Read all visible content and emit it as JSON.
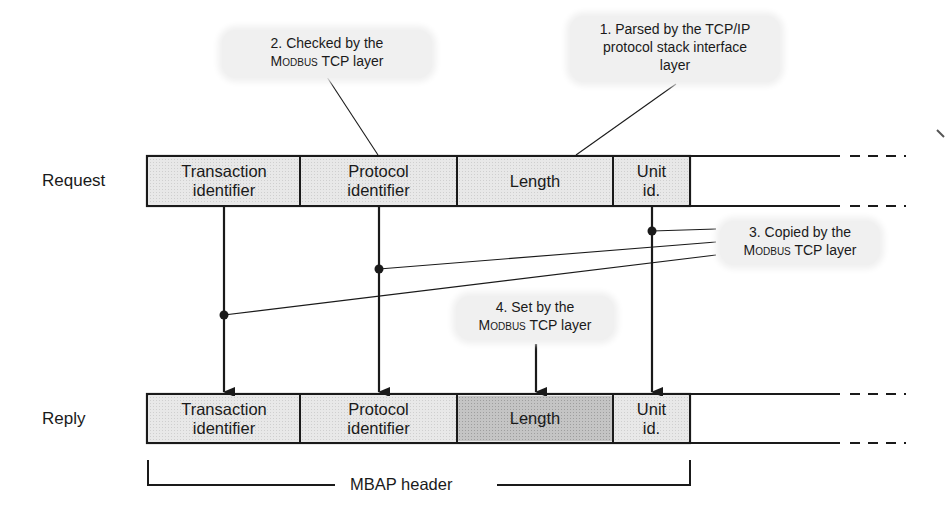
{
  "diagram": {
    "type": "protocol-frame-flow",
    "rows": {
      "request": {
        "label": "Request",
        "fields": [
          {
            "line1": "Transaction",
            "line2": "identifier",
            "shade": "light"
          },
          {
            "line1": "Protocol",
            "line2": "identifier",
            "shade": "light"
          },
          {
            "line1": "Length",
            "line2": "",
            "shade": "light"
          },
          {
            "line1": "Unit",
            "line2": "id.",
            "shade": "light"
          }
        ]
      },
      "reply": {
        "label": "Reply",
        "fields": [
          {
            "line1": "Transaction",
            "line2": "identifier",
            "shade": "light"
          },
          {
            "line1": "Protocol",
            "line2": "identifier",
            "shade": "light"
          },
          {
            "line1": "Length",
            "line2": "",
            "shade": "dark"
          },
          {
            "line1": "Unit",
            "line2": "id.",
            "shade": "light"
          }
        ]
      }
    },
    "callouts": [
      {
        "id": 1,
        "line1": "1. Parsed by the TCP/IP",
        "line2": "protocol stack interface",
        "line3": "layer",
        "target": "request.Length"
      },
      {
        "id": 2,
        "line1": "2. Checked by the",
        "line2_sc": "Modbus",
        "line2_rest": " TCP layer",
        "target": "request.Protocol identifier"
      },
      {
        "id": 3,
        "line1": "3. Copied by the",
        "line2_sc": "Modbus",
        "line2_rest": " TCP layer",
        "targets": [
          "Transaction identifier",
          "Protocol identifier",
          "Unit id."
        ]
      },
      {
        "id": 4,
        "line1": "4. Set by the",
        "line2_sc": "Modbus",
        "line2_rest": " TCP layer",
        "target": "reply.Length"
      }
    ],
    "bracket": {
      "label": "MBAP header"
    },
    "colors": {
      "line": "#1a1a1a",
      "field_light": "#e8e8e8",
      "field_dark": "#c4c4c4",
      "bubble": "#f0f0f0"
    }
  }
}
